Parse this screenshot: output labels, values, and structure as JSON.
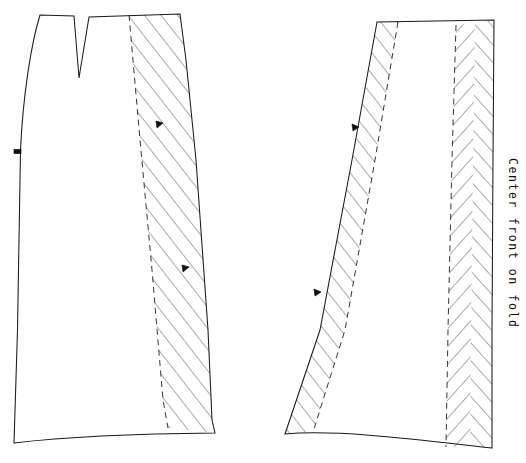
{
  "document": {
    "kind": "sewing-pattern-diagram",
    "title": "Skirt pattern pieces",
    "background_color": "#ffffff",
    "line_color": "#1a1a1a",
    "hatch_color": "#3a3a3a",
    "width": 526,
    "height": 463
  },
  "labels": {
    "center_front_on_fold": "Center front on fold"
  },
  "pieces": [
    {
      "id": "back-piece",
      "name": "Back skirt panel with waist dart",
      "cut_outline": "M 40,15 C 30,45 22,95 20,150 L 17,330 L 14,443 C 70,437 150,434 215,433 L 212,420 L 196,160 L 186,60 L 180,14 L 89,17 L 79,78 L 74,16 Z",
      "dart": {
        "left_x": 74,
        "apex_x": 79,
        "apex_y": 78,
        "right_x": 89,
        "top_y": 16
      },
      "notches": [
        {
          "x": 17,
          "y": 152,
          "angle": 92
        },
        {
          "x": 160,
          "y": 124,
          "angle": 8
        },
        {
          "x": 186,
          "y": 268,
          "angle": 6
        }
      ],
      "seam_allowance_bands": [
        {
          "id": "back-side-seam-allowance",
          "hatch_style": "diagonal",
          "inner_seamline": "M 129,15 L 140,140 L 152,270 L 163,400 L 168,428",
          "outer_cutline": "M 180,14 L 186,60 L 196,160 L 208,330 L 212,420 L 215,433"
        }
      ]
    },
    {
      "id": "front-piece",
      "name": "Front skirt panel cut on fold",
      "cut_outline": "M 377,22 L 352,160 L 320,330 L 285,434 C 350,430 430,442 492,448 L 493,260 L 494,120 L 494,20 Z",
      "notches": [
        {
          "x": 356,
          "y": 128,
          "angle": 100
        },
        {
          "x": 318,
          "y": 293,
          "angle": 100
        }
      ],
      "seam_allowance_bands": [
        {
          "id": "front-side-seam-allowance",
          "hatch_style": "diagonal",
          "outer_cutline": "M 377,22 L 352,160 L 320,330 L 285,434",
          "inner_seamline": "M 398,22 L 375,160 L 345,330 L 313,432"
        },
        {
          "id": "front-center-fold-allowance",
          "hatch_style": "chevron",
          "inner_seamline": "M 456,25 L 452,160 L 448,330 L 446,447",
          "outer_cutline": "M 494,20 L 493,160 L 492,330 L 492,448"
        }
      ]
    }
  ],
  "legend": {
    "solid_line_meaning": "cutting line",
    "dashed_line_meaning": "seam line",
    "hatched_band_meaning": "seam allowance"
  }
}
